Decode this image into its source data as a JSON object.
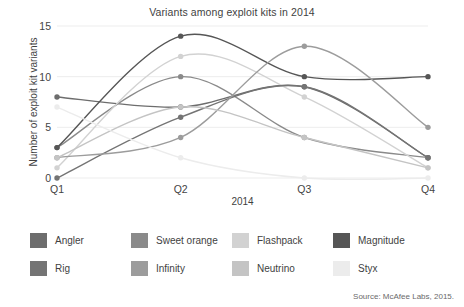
{
  "chart_data": {
    "type": "line",
    "title": "Variants among exploit kits in 2014",
    "xlabel": "2014",
    "ylabel": "Number of exploit kit variants",
    "categories": [
      "Q1",
      "Q2",
      "Q3",
      "Q4"
    ],
    "ylim": [
      0,
      15
    ],
    "yticks": [
      0,
      5,
      10,
      15
    ],
    "ytick_labels": [
      "0",
      "5",
      "10",
      "15"
    ],
    "grid": true,
    "legend_position": "bottom",
    "markers": true,
    "smoothing": "spline",
    "series": [
      {
        "name": "Angler",
        "color": "#6d6d6d",
        "values": [
          8,
          7,
          9,
          2
        ]
      },
      {
        "name": "Sweet orange",
        "color": "#8a8a8a",
        "values": [
          3,
          10,
          4,
          2
        ]
      },
      {
        "name": "Flashpack",
        "color": "#d2d2d2",
        "values": [
          1,
          12,
          8,
          1
        ]
      },
      {
        "name": "Magnitude",
        "color": "#565656",
        "values": [
          3,
          14,
          10,
          10
        ]
      },
      {
        "name": "Rig",
        "color": "#747474",
        "values": [
          0,
          6,
          9,
          2
        ]
      },
      {
        "name": "Infinity",
        "color": "#9c9c9c",
        "values": [
          2,
          4,
          13,
          5
        ]
      },
      {
        "name": "Neutrino",
        "color": "#c4c4c4",
        "values": [
          2,
          7,
          4,
          1
        ]
      },
      {
        "name": "Styx",
        "color": "#ececec",
        "values": [
          7,
          2,
          0,
          0
        ]
      }
    ]
  },
  "source": {
    "text": "Source: McAfee Labs, 2015."
  }
}
